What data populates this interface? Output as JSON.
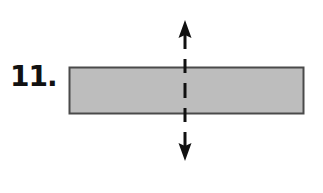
{
  "problem": {
    "number_label": "11."
  },
  "figure": {
    "shape": "rectangle",
    "rect": {
      "x": 69,
      "y": 67,
      "width": 234,
      "height": 46
    },
    "fill_color": "#bdbdbd",
    "stroke_color": "#4a4a4a",
    "line_of_symmetry": {
      "orientation": "vertical",
      "x": 185,
      "y_top": 20,
      "y_bottom": 161,
      "style": "dashed",
      "arrowheads": [
        "up",
        "down"
      ],
      "color": "#111111"
    }
  }
}
